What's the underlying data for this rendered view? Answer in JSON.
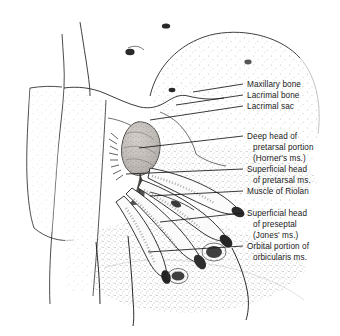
{
  "figure": {
    "style": "stippled pen-and-ink medical illustration",
    "background_color": "#ffffff",
    "ink_color": "#1a1a1a",
    "stipple_color": "#8f8f8f",
    "sac_fill_color": "#b9b5b2"
  },
  "labels": [
    {
      "name": "maxillary-bone",
      "lines": [
        "Maxillary bone"
      ],
      "text_x": 247,
      "text_y": 80,
      "leader": {
        "x1": 193,
        "y1": 92,
        "x2": 243,
        "y2": 84
      }
    },
    {
      "name": "lacrimal-bone",
      "lines": [
        "Lacrimal bone"
      ],
      "text_x": 247,
      "text_y": 91,
      "leader": {
        "x1": 176,
        "y1": 105,
        "x2": 243,
        "y2": 95
      }
    },
    {
      "name": "lacrimal-sac",
      "lines": [
        "Lacrimal sac"
      ],
      "text_x": 247,
      "text_y": 102,
      "leader": {
        "x1": 150,
        "y1": 120,
        "x2": 243,
        "y2": 106
      }
    },
    {
      "name": "deep-head-pretarsal-horner",
      "lines": [
        "Deep head of",
        "pretarsal portion",
        "(Horner's ms.)"
      ],
      "text_x": 247,
      "text_y": 132,
      "leader": {
        "x1": 139,
        "y1": 148,
        "x2": 243,
        "y2": 136
      }
    },
    {
      "name": "superficial-head-pretarsal",
      "lines": [
        "Superficial head",
        "of pretarsal ms."
      ],
      "text_x": 247,
      "text_y": 165,
      "leader": {
        "x1": 126,
        "y1": 174,
        "x2": 243,
        "y2": 169
      }
    },
    {
      "name": "muscle-of-riolan",
      "lines": [
        "Muscle of Riolan"
      ],
      "text_x": 247,
      "text_y": 187,
      "leader": {
        "x1": 150,
        "y1": 196,
        "x2": 243,
        "y2": 191
      }
    },
    {
      "name": "superficial-head-preseptal-jones",
      "lines": [
        "Superficial head",
        "of preseptal",
        "(Jones' ms.)"
      ],
      "text_x": 247,
      "text_y": 209,
      "leader": {
        "x1": 160,
        "y1": 222,
        "x2": 243,
        "y2": 213
      }
    },
    {
      "name": "orbital-portion-orbicularis",
      "lines": [
        "Orbital portion of",
        "orbicularis ms."
      ],
      "text_x": 247,
      "text_y": 242,
      "leader": {
        "x1": 148,
        "y1": 252,
        "x2": 243,
        "y2": 246
      }
    }
  ]
}
